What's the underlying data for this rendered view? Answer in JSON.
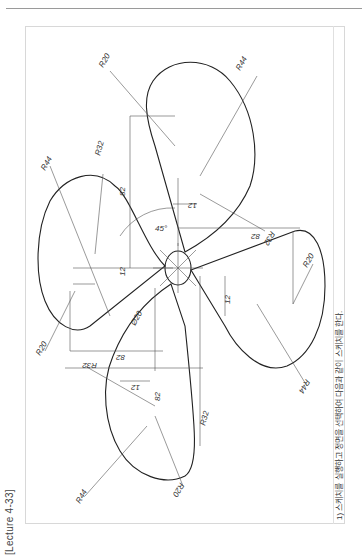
{
  "page": {
    "lecture_label": "[Lecture 4-33]",
    "instruction": "1) 스케치를 실행하고 정면을 선택하여 다음과 같이 스케치를 한다."
  },
  "drawing": {
    "type": "propeller-sketch",
    "center_circle": "Ø20",
    "angle": "45°",
    "dimensions": {
      "blade_top": {
        "r_large": "R44",
        "r_small": "R20",
        "offset": "12",
        "length": "82",
        "r_side": "R32"
      },
      "blade_left": {
        "r_large": "R44",
        "r_small": "R20",
        "offset": "12",
        "length": "82",
        "r_side": "R32"
      },
      "blade_right": {
        "r_large": "R44",
        "r_small": "R20",
        "offset": "12",
        "length": "82",
        "r_side": "R32"
      },
      "blade_bottom": {
        "r_large": "R44",
        "r_small": "R20",
        "offset": "12",
        "length": "82",
        "r_side": "R32"
      }
    }
  },
  "colors": {
    "line": "#222222",
    "thin": "#555555",
    "frame": "#d8d8d8",
    "rule": "#9a9a9a"
  }
}
